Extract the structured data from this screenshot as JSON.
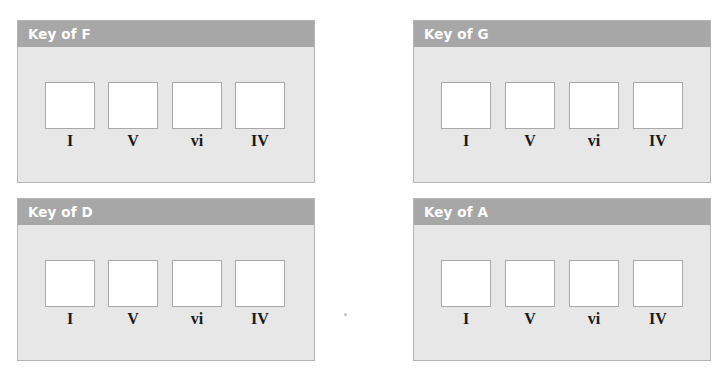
{
  "panels": [
    {
      "title": "Key of F",
      "chords": [
        "I",
        "V",
        "vi",
        "IV"
      ]
    },
    {
      "title": "Key of G",
      "chords": [
        "I",
        "V",
        "vi",
        "IV"
      ]
    },
    {
      "title": "Key of D",
      "chords": [
        "I",
        "V",
        "vi",
        "IV"
      ]
    },
    {
      "title": "Key of A",
      "chords": [
        "I",
        "V",
        "vi",
        "IV"
      ]
    }
  ],
  "colors": {
    "header_bg": "#a7a7a7",
    "panel_bg": "#e7e7e7",
    "slot_bg": "#ffffff",
    "border": "#b4b4b4"
  }
}
